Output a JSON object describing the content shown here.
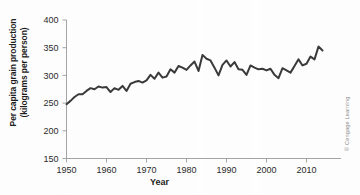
{
  "figure": {
    "credit": "© Cengage Learning",
    "line_color": "#3a3a3a",
    "axis_color": "#9a9a9a",
    "background": "#fdfdfd"
  },
  "axis_labels": {
    "y_line1": "Per capita grain production",
    "y_line2": "(kilograms per person)",
    "x": "Year"
  },
  "chart_data": {
    "type": "line",
    "title": "",
    "xlabel": "Year",
    "ylabel": "Per capita grain production (kilograms per person)",
    "xlim": [
      1950,
      2014
    ],
    "ylim": [
      150,
      400
    ],
    "xticks": [
      1950,
      1960,
      1970,
      1980,
      1990,
      2000,
      2010
    ],
    "yticks": [
      150,
      200,
      250,
      300,
      350,
      400
    ],
    "xtick_labels": [
      "1950",
      "1960",
      "1970",
      "1980",
      "1990",
      "2000",
      "2010"
    ],
    "ytick_labels": [
      "150",
      "200",
      "250",
      "300",
      "350",
      "400"
    ],
    "grid": false,
    "legend": null,
    "series": [
      {
        "name": "World per capita grain production",
        "x": [
          1950,
          1951,
          1952,
          1953,
          1954,
          1955,
          1956,
          1957,
          1958,
          1959,
          1960,
          1961,
          1962,
          1963,
          1964,
          1965,
          1966,
          1967,
          1968,
          1969,
          1970,
          1971,
          1972,
          1973,
          1974,
          1975,
          1976,
          1977,
          1978,
          1979,
          1980,
          1981,
          1982,
          1983,
          1984,
          1985,
          1986,
          1987,
          1988,
          1989,
          1990,
          1991,
          1992,
          1993,
          1994,
          1995,
          1996,
          1997,
          1998,
          1999,
          2000,
          2001,
          2002,
          2003,
          2004,
          2005,
          2006,
          2007,
          2008,
          2009,
          2010,
          2011,
          2012,
          2013,
          2014
        ],
        "values": [
          248,
          254,
          261,
          266,
          266,
          272,
          277,
          275,
          280,
          278,
          279,
          270,
          277,
          274,
          281,
          272,
          285,
          288,
          290,
          287,
          291,
          301,
          294,
          305,
          296,
          298,
          311,
          305,
          317,
          314,
          310,
          318,
          325,
          308,
          337,
          330,
          327,
          314,
          300,
          319,
          327,
          316,
          324,
          311,
          310,
          301,
          318,
          314,
          311,
          312,
          309,
          312,
          301,
          295,
          313,
          309,
          305,
          317,
          329,
          318,
          321,
          334,
          329,
          352,
          345
        ]
      }
    ]
  }
}
